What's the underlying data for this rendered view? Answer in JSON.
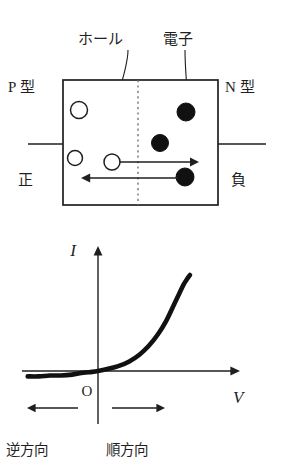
{
  "figure": {
    "title_semantic": "pn-junction-diode-and-iv-characteristic",
    "colors": {
      "stroke": "#1f1f1f",
      "fill_electron": "#111111",
      "fill_hole": "#ffffff",
      "junction_dotted": "#6b6b6b",
      "background": "#ffffff"
    }
  },
  "diagram": {
    "labels": {
      "hole": "ホール",
      "electron": "電子",
      "p_type": "P 型",
      "n_type": "N 型",
      "terminal_positive": "正",
      "terminal_negative": "負"
    },
    "carriers": [
      {
        "kind": "hole",
        "label": "ホール",
        "cx": 79,
        "cy": 110,
        "r": 8.5
      },
      {
        "kind": "hole",
        "label": "ホール",
        "cx": 75,
        "cy": 158,
        "r": 7.5
      },
      {
        "kind": "hole",
        "label": "ホール",
        "cx": 112,
        "cy": 162,
        "r": 8.0
      },
      {
        "kind": "electron",
        "label": "電子",
        "cx": 186,
        "cy": 112,
        "r": 9.0
      },
      {
        "kind": "electron",
        "label": "電子",
        "cx": 160,
        "cy": 143,
        "r": 8.5
      },
      {
        "kind": "electron",
        "label": "電子",
        "cx": 185,
        "cy": 177,
        "r": 9.0
      }
    ],
    "drift_arrows": [
      {
        "name": "hole-drift-arrow",
        "direction": "right",
        "from_x": 120,
        "to_x": 198,
        "y": 162
      },
      {
        "name": "electron-drift-arrow",
        "direction": "left",
        "from_x": 178,
        "to_x": 82,
        "y": 178
      }
    ]
  },
  "chart_data": {
    "type": "line",
    "title": "",
    "xlabel": "V",
    "ylabel": "I",
    "origin_label": "O",
    "grid": false,
    "legend": null,
    "annotations": [
      {
        "text": "逆方向",
        "meaning": "reverse-direction",
        "side": "left"
      },
      {
        "text": "順方向",
        "meaning": "forward-direction",
        "side": "right"
      }
    ],
    "axis_arrows": {
      "x": "right",
      "y": "up"
    },
    "series": [
      {
        "name": "diode-iv-curve",
        "x": [
          -0.95,
          -0.8,
          -0.65,
          -0.5,
          -0.35,
          -0.2,
          -0.08,
          0.0,
          0.1,
          0.22,
          0.34,
          0.45,
          0.55,
          0.65,
          0.74,
          0.82,
          0.88,
          0.93,
          0.97,
          1.0
        ],
        "y": [
          -0.06,
          -0.06,
          -0.05,
          -0.05,
          -0.04,
          -0.02,
          -0.01,
          0.0,
          0.02,
          0.05,
          0.1,
          0.17,
          0.26,
          0.38,
          0.52,
          0.68,
          0.8,
          0.9,
          0.96,
          1.0
        ]
      }
    ],
    "xlim": [
      -1.05,
      1.15
    ],
    "ylim": [
      -0.12,
      1.12
    ]
  }
}
